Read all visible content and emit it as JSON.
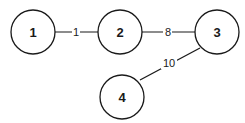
{
  "diagram": {
    "type": "weighted-graph",
    "nodes": [
      {
        "id": "1",
        "label": "1",
        "cx": 33,
        "cy": 32
      },
      {
        "id": "2",
        "label": "2",
        "cx": 120,
        "cy": 32
      },
      {
        "id": "3",
        "label": "3",
        "cx": 217,
        "cy": 32
      },
      {
        "id": "4",
        "label": "4",
        "cx": 122,
        "cy": 97
      }
    ],
    "edges": [
      {
        "from": "1",
        "to": "2",
        "weight": "1"
      },
      {
        "from": "2",
        "to": "3",
        "weight": "8"
      },
      {
        "from": "3",
        "to": "4",
        "weight": "10"
      }
    ]
  }
}
